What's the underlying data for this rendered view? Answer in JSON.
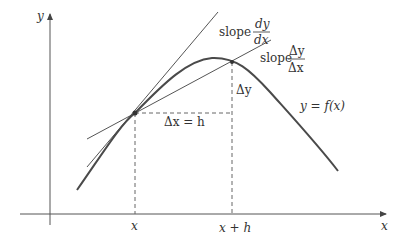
{
  "diagram": {
    "axes": {
      "x_label": "x",
      "y_label": "y"
    },
    "points": {
      "x_tick_label": "x",
      "x_plus_h_tick_label": "x + h"
    },
    "annotations": {
      "tangent_slope_word": "slope",
      "tangent_slope_num": "dy",
      "tangent_slope_den": "dx",
      "secant_slope_word": "slope",
      "secant_slope_num": "Δy",
      "secant_slope_den": "Δx",
      "delta_y": "Δy",
      "delta_x_eq_h": "Δx = h",
      "curve_label": "y = f(x)"
    },
    "colors": {
      "stroke": "#555555",
      "curve": "#4a4a4a",
      "text": "#333333"
    }
  }
}
